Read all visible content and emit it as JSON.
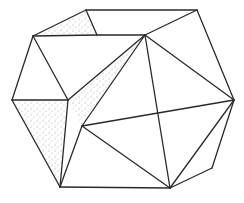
{
  "diagram": {
    "title": "Polyhedron line drawing",
    "type": "polyhedron-wireframe",
    "colors": {
      "line": "#2a2a2a",
      "background": "#ffffff",
      "stipple": "#555555"
    },
    "vertices": {
      "A": [
        86,
        10
      ],
      "B": [
        197,
        10
      ],
      "C": [
        33,
        36
      ],
      "D": [
        97,
        35
      ],
      "E": [
        145,
        35
      ],
      "F": [
        12,
        100
      ],
      "G": [
        68,
        100
      ],
      "H": [
        234,
        100
      ],
      "I": [
        82,
        126
      ],
      "J": [
        60,
        187
      ],
      "K": [
        170,
        188
      ],
      "L": [
        212,
        168
      ]
    },
    "edges": [
      [
        "A",
        "B"
      ],
      [
        "A",
        "C"
      ],
      [
        "A",
        "D"
      ],
      [
        "C",
        "D"
      ],
      [
        "D",
        "E"
      ],
      [
        "B",
        "E"
      ],
      [
        "B",
        "H"
      ],
      [
        "C",
        "F"
      ],
      [
        "C",
        "G"
      ],
      [
        "F",
        "G"
      ],
      [
        "F",
        "J"
      ],
      [
        "G",
        "J"
      ],
      [
        "E",
        "I"
      ],
      [
        "E",
        "K"
      ],
      [
        "I",
        "J"
      ],
      [
        "I",
        "H"
      ],
      [
        "I",
        "K"
      ],
      [
        "J",
        "K"
      ],
      [
        "K",
        "H"
      ],
      [
        "K",
        "L"
      ],
      [
        "L",
        "H"
      ],
      [
        "G",
        "E"
      ],
      [
        "E",
        "H"
      ]
    ],
    "shaded_faces": [
      {
        "name": "top-left-triangle",
        "vertices": [
          "A",
          "C",
          "D"
        ]
      },
      {
        "name": "center-triangle",
        "vertices": [
          "E",
          "I",
          "G"
        ]
      },
      {
        "name": "left-lower-quad",
        "vertices": [
          "F",
          "G",
          "J"
        ]
      }
    ]
  }
}
